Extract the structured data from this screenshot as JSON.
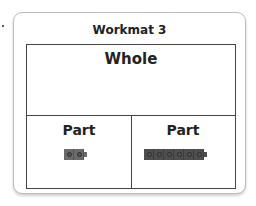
{
  "workmat": {
    "title": "Workmat 3",
    "whole_label": "Whole",
    "parts": [
      {
        "label": "Part",
        "cube_count": 2,
        "cube_color": "#6b6b6b"
      },
      {
        "label": "Part",
        "cube_count": 6,
        "cube_color": "#4e4e4e"
      }
    ]
  }
}
